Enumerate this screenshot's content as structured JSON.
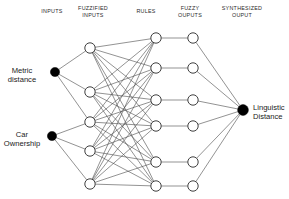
{
  "diagram": {
    "background_color": "#ffffff",
    "line_color": "#4a4a4a",
    "node_stroke_color": "#2a2a2a",
    "node_fill_color": "#ffffff",
    "terminal_node_color": "#000000",
    "headers": [
      {
        "key": "inputs",
        "label": "INPUTS",
        "x": 52,
        "y": 8
      },
      {
        "key": "fuzzified_inputs",
        "label": "FUZZIFIED\nINPUTS",
        "x": 93,
        "y": 5
      },
      {
        "key": "rules",
        "label": "RULES",
        "x": 146,
        "y": 8
      },
      {
        "key": "fuzzy_outputs",
        "label": "FUZZY\nOUPUTS",
        "x": 190,
        "y": 5
      },
      {
        "key": "synthesized_output",
        "label": "SYNTHESIZED\nOUPUT",
        "x": 242,
        "y": 5
      }
    ],
    "input_labels": [
      {
        "key": "metric-distance",
        "label": "Metric\ndistance",
        "x": 22,
        "y": 66
      },
      {
        "key": "car-ownership",
        "label": "Car\nOwnership",
        "x": 22,
        "y": 130
      }
    ],
    "output_labels": [
      {
        "key": "linguistic-distance",
        "label": "Linguistic\nDistance",
        "x": 253,
        "y": 103
      }
    ],
    "layers": {
      "inputs": {
        "name": "inputs",
        "style": "filled",
        "radius": 4.6,
        "nodes": [
          {
            "id": "in1",
            "x": 55,
            "y": 72
          },
          {
            "id": "in2",
            "x": 52,
            "y": 136
          }
        ]
      },
      "fuzzified_inputs": {
        "name": "fuzzified-inputs",
        "style": "hollow",
        "radius": 5.2,
        "nodes": [
          {
            "id": "fz1",
            "x": 90,
            "y": 48
          },
          {
            "id": "fz2",
            "x": 90,
            "y": 92
          },
          {
            "id": "fz3",
            "x": 90,
            "y": 122
          },
          {
            "id": "fz4",
            "x": 90,
            "y": 151
          },
          {
            "id": "fz5",
            "x": 90,
            "y": 184
          }
        ]
      },
      "rules": {
        "name": "rules",
        "style": "hollow",
        "radius": 5.2,
        "nodes": [
          {
            "id": "r1",
            "x": 156,
            "y": 38
          },
          {
            "id": "r2",
            "x": 156,
            "y": 68
          },
          {
            "id": "r3",
            "x": 156,
            "y": 100
          },
          {
            "id": "r4",
            "x": 156,
            "y": 126
          },
          {
            "id": "r5",
            "x": 156,
            "y": 162
          },
          {
            "id": "r6",
            "x": 156,
            "y": 186
          }
        ]
      },
      "fuzzy_outputs": {
        "name": "fuzzy-outputs",
        "style": "hollow",
        "radius": 5.2,
        "nodes": [
          {
            "id": "fo1",
            "x": 193,
            "y": 38
          },
          {
            "id": "fo2",
            "x": 193,
            "y": 68
          },
          {
            "id": "fo3",
            "x": 193,
            "y": 100
          },
          {
            "id": "fo4",
            "x": 193,
            "y": 126
          },
          {
            "id": "fo5",
            "x": 193,
            "y": 162
          },
          {
            "id": "fo6",
            "x": 193,
            "y": 186
          }
        ]
      },
      "synthesized_output": {
        "name": "synthesized-output",
        "style": "filled",
        "radius": 5.4,
        "nodes": [
          {
            "id": "out1",
            "x": 243,
            "y": 110
          }
        ]
      }
    },
    "edges": {
      "inputs_to_fuzzified": [
        [
          "in1",
          "fz1"
        ],
        [
          "in1",
          "fz2"
        ],
        [
          "in1",
          "fz3"
        ],
        [
          "in2",
          "fz3"
        ],
        [
          "in2",
          "fz4"
        ],
        [
          "in2",
          "fz5"
        ]
      ],
      "fuzzified_to_rules": [
        [
          "fz1",
          "r1"
        ],
        [
          "fz1",
          "r2"
        ],
        [
          "fz1",
          "r3"
        ],
        [
          "fz1",
          "r4"
        ],
        [
          "fz1",
          "r5"
        ],
        [
          "fz1",
          "r6"
        ],
        [
          "fz2",
          "r1"
        ],
        [
          "fz2",
          "r2"
        ],
        [
          "fz2",
          "r3"
        ],
        [
          "fz2",
          "r4"
        ],
        [
          "fz2",
          "r5"
        ],
        [
          "fz2",
          "r6"
        ],
        [
          "fz3",
          "r1"
        ],
        [
          "fz3",
          "r2"
        ],
        [
          "fz3",
          "r3"
        ],
        [
          "fz3",
          "r4"
        ],
        [
          "fz3",
          "r5"
        ],
        [
          "fz3",
          "r6"
        ],
        [
          "fz4",
          "r1"
        ],
        [
          "fz4",
          "r2"
        ],
        [
          "fz4",
          "r3"
        ],
        [
          "fz4",
          "r4"
        ],
        [
          "fz4",
          "r5"
        ],
        [
          "fz4",
          "r6"
        ],
        [
          "fz5",
          "r1"
        ],
        [
          "fz5",
          "r2"
        ],
        [
          "fz5",
          "r3"
        ],
        [
          "fz5",
          "r4"
        ],
        [
          "fz5",
          "r5"
        ],
        [
          "fz5",
          "r6"
        ]
      ],
      "rules_to_fuzzy_outputs": [
        [
          "r1",
          "fo1"
        ],
        [
          "r2",
          "fo2"
        ],
        [
          "r3",
          "fo3"
        ],
        [
          "r4",
          "fo4"
        ],
        [
          "r5",
          "fo5"
        ],
        [
          "r6",
          "fo6"
        ]
      ],
      "fuzzy_outputs_to_output": [
        [
          "fo1",
          "out1"
        ],
        [
          "fo2",
          "out1"
        ],
        [
          "fo3",
          "out1"
        ],
        [
          "fo4",
          "out1"
        ],
        [
          "fo5",
          "out1"
        ],
        [
          "fo6",
          "out1"
        ]
      ]
    }
  }
}
